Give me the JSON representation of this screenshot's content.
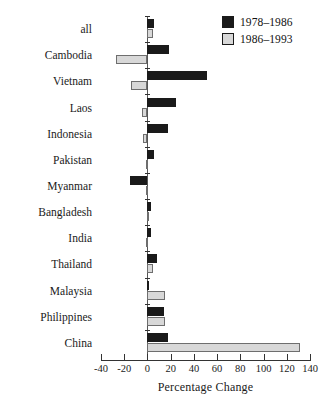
{
  "chart_data": {
    "type": "bar",
    "orientation": "horizontal",
    "title": "",
    "xlabel": "Percentage Change",
    "ylabel": "",
    "xlim": [
      -40,
      140
    ],
    "xticks": [
      -40,
      -20,
      0,
      20,
      40,
      60,
      80,
      100,
      120,
      140
    ],
    "xticklabels": [
      "-40",
      "-20",
      "0",
      "20",
      "40",
      "60",
      "80",
      "100",
      "120",
      "140"
    ],
    "grid": false,
    "legend_position": "top-right",
    "categories": [
      "all",
      "Cambodia",
      "Vietnam",
      "Laos",
      "Indonesia",
      "Pakistan",
      "Myanmar",
      "Bangladesh",
      "India",
      "Thailand",
      "Malaysia",
      "Philippines",
      "China"
    ],
    "series": [
      {
        "name": "1978–1986",
        "color": "#1a1a1a",
        "values": [
          6,
          19,
          51,
          25,
          18,
          6,
          -15,
          3,
          3,
          8,
          0.5,
          14,
          18
        ]
      },
      {
        "name": "1986–1993",
        "color": "#d8d8d8",
        "values": [
          4.5,
          -27,
          -14,
          -5,
          -4,
          -1,
          -1.5,
          1,
          -1.5,
          5,
          15,
          15,
          131
        ]
      }
    ]
  },
  "legend": {
    "entries": [
      {
        "label": "1978–1986",
        "swatch": "black-swatch"
      },
      {
        "label": "1986–1993",
        "swatch": "gray-swatch"
      }
    ]
  },
  "axis": {
    "x_title": "Percentage Change"
  }
}
